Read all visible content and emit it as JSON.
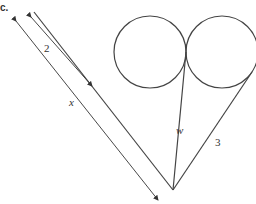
{
  "part_label": "c.",
  "labels": {
    "segment_2": "2",
    "segment_x": "x",
    "segment_w": "w",
    "segment_3": "3"
  },
  "geometry": {
    "apex": [
      173,
      190
    ],
    "circle_left": {
      "cx": 150,
      "cy": 52,
      "r": 36
    },
    "circle_right": {
      "cx": 222,
      "cy": 52,
      "r": 36
    },
    "tangent_point": [
      186,
      52
    ],
    "left_line_top": [
      34,
      12
    ],
    "right_line_top": [
      252,
      72
    ]
  },
  "colors": {
    "stroke": "#444444"
  }
}
